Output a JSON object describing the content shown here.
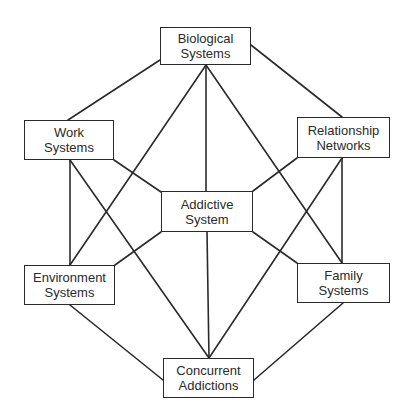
{
  "diagram": {
    "type": "network",
    "colors": {
      "stroke": "#2a2a2a",
      "background": "#ffffff",
      "text": "#2a2a2a"
    },
    "nodes": [
      {
        "id": "biological",
        "line1": "Biological",
        "line2": "Systems",
        "x": 160,
        "y": 27,
        "w": 91,
        "h": 38
      },
      {
        "id": "work",
        "line1": "Work",
        "line2": "Systems",
        "x": 24,
        "y": 120,
        "w": 90,
        "h": 40
      },
      {
        "id": "relationship",
        "line1": "Relationship",
        "line2": "Networks",
        "x": 297,
        "y": 117,
        "w": 93,
        "h": 41
      },
      {
        "id": "addictive",
        "line1": "Addictive",
        "line2": "System",
        "x": 161,
        "y": 191,
        "w": 92,
        "h": 41
      },
      {
        "id": "environment",
        "line1": "Environment",
        "line2": "Systems",
        "x": 24,
        "y": 265,
        "w": 91,
        "h": 40
      },
      {
        "id": "family",
        "line1": "Family",
        "line2": "Systems",
        "x": 297,
        "y": 263,
        "w": 93,
        "h": 40
      },
      {
        "id": "concurrent",
        "line1": "Concurrent",
        "line2": "Addictions",
        "x": 163,
        "y": 358,
        "w": 91,
        "h": 40
      }
    ],
    "edges": [
      {
        "from": "biological",
        "to": "work",
        "x1": 160,
        "y1": 60,
        "x2": 68,
        "y2": 120
      },
      {
        "from": "biological",
        "to": "relationship",
        "x1": 251,
        "y1": 45,
        "x2": 342,
        "y2": 117
      },
      {
        "from": "biological",
        "to": "addictive",
        "x1": 206,
        "y1": 65,
        "x2": 206,
        "y2": 191
      },
      {
        "from": "biological",
        "to": "environment",
        "x1": 206,
        "y1": 65,
        "x2": 70,
        "y2": 265
      },
      {
        "from": "biological",
        "to": "family",
        "x1": 206,
        "y1": 65,
        "x2": 342,
        "y2": 263
      },
      {
        "from": "work",
        "to": "environment",
        "x1": 70,
        "y1": 160,
        "x2": 70,
        "y2": 265
      },
      {
        "from": "work",
        "to": "concurrent",
        "x1": 70,
        "y1": 160,
        "x2": 209,
        "y2": 358
      },
      {
        "from": "work",
        "to": "addictive",
        "x1": 114,
        "y1": 160,
        "x2": 161,
        "y2": 192
      },
      {
        "from": "relationship",
        "to": "addictive",
        "x1": 297,
        "y1": 158,
        "x2": 253,
        "y2": 191
      },
      {
        "from": "relationship",
        "to": "family",
        "x1": 342,
        "y1": 158,
        "x2": 342,
        "y2": 263
      },
      {
        "from": "relationship",
        "to": "concurrent",
        "x1": 342,
        "y1": 158,
        "x2": 209,
        "y2": 358
      },
      {
        "from": "addictive",
        "to": "environment",
        "x1": 161,
        "y1": 232,
        "x2": 115,
        "y2": 265
      },
      {
        "from": "addictive",
        "to": "family",
        "x1": 253,
        "y1": 232,
        "x2": 297,
        "y2": 263
      },
      {
        "from": "addictive",
        "to": "concurrent",
        "x1": 207,
        "y1": 232,
        "x2": 209,
        "y2": 358
      },
      {
        "from": "environment",
        "to": "concurrent",
        "x1": 70,
        "y1": 305,
        "x2": 163,
        "y2": 380
      },
      {
        "from": "family",
        "to": "concurrent",
        "x1": 343,
        "y1": 303,
        "x2": 254,
        "y2": 380
      }
    ]
  }
}
